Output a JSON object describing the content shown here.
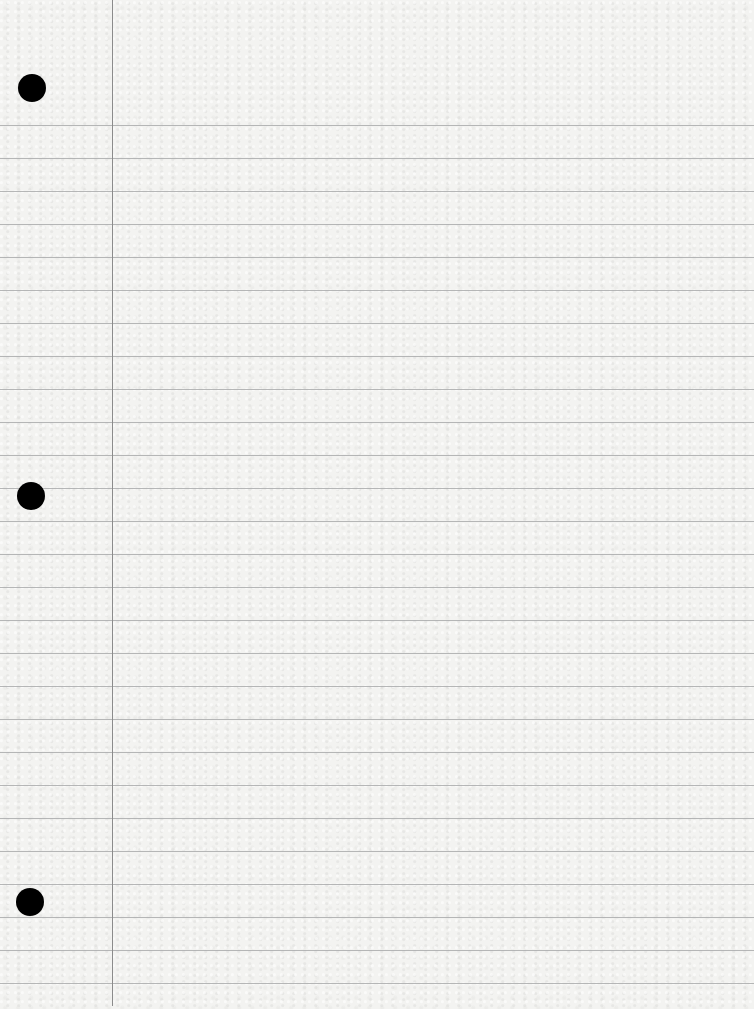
{
  "paper": {
    "type": "lined-notebook-paper",
    "background_color": "#f3f3f1",
    "rule_color": "#a9aaab",
    "margin_line_color": "#8b8b8b",
    "margin_line_x": 112,
    "first_rule_y": 125,
    "rule_spacing": 33,
    "rule_count": 27,
    "holes": [
      {
        "x": 32,
        "y": 88
      },
      {
        "x": 31,
        "y": 496
      },
      {
        "x": 30,
        "y": 902
      }
    ]
  }
}
